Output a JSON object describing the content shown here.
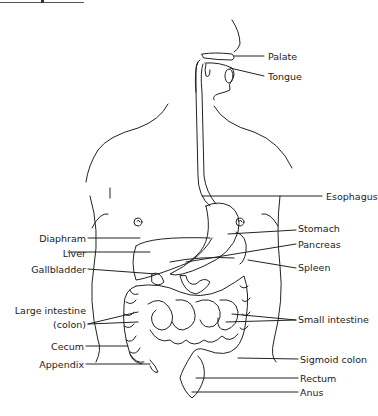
{
  "diagram": {
    "labels_right": [
      {
        "id": "palate",
        "text": "Palate"
      },
      {
        "id": "tongue",
        "text": "Tongue"
      },
      {
        "id": "esophagus",
        "text": "Esophagus"
      },
      {
        "id": "stomach",
        "text": "Stomach"
      },
      {
        "id": "pancreas",
        "text": "Pancreas"
      },
      {
        "id": "spleen",
        "text": "Spleen"
      },
      {
        "id": "small-intestine",
        "text": "Small intestine"
      },
      {
        "id": "sigmoid-colon",
        "text": "Sigmoid colon"
      },
      {
        "id": "rectum",
        "text": "Rectum"
      },
      {
        "id": "anus",
        "text": "Anus"
      }
    ],
    "labels_left": [
      {
        "id": "diaphram",
        "text": "Diaphram"
      },
      {
        "id": "liver",
        "text": "Liver"
      },
      {
        "id": "gallbladder",
        "text": "Gallbladder"
      },
      {
        "id": "large-intestine",
        "text": "Large intestine"
      },
      {
        "id": "colon-paren",
        "text": "(colon)"
      },
      {
        "id": "cecum",
        "text": "Cecum"
      },
      {
        "id": "appendix",
        "text": "Appendix"
      }
    ]
  }
}
